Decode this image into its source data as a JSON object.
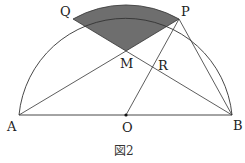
{
  "figure": {
    "caption": "図2",
    "colors": {
      "line": "#333333",
      "shade": "#6e6e6e",
      "background": "#ffffff"
    },
    "points": {
      "A": {
        "label": "A",
        "x": 19,
        "y": 115
      },
      "O": {
        "label": "O",
        "x": 126,
        "y": 115
      },
      "B": {
        "label": "B",
        "x": 232,
        "y": 115
      },
      "P": {
        "label": "P",
        "x": 179,
        "y": 19
      },
      "Q": {
        "label": "Q",
        "x": 73,
        "y": 19
      },
      "M": {
        "label": "M",
        "x": 126,
        "y": 51
      },
      "R": {
        "label": "R",
        "x": 155,
        "y": 60
      }
    },
    "segments": [
      "AB",
      "AP",
      "BQ",
      "OP",
      "PB",
      "MQ",
      "MP"
    ],
    "shaded_region": "sector QMP bounded by arc QP",
    "shape": "semicircle with diameter AB and center O"
  }
}
